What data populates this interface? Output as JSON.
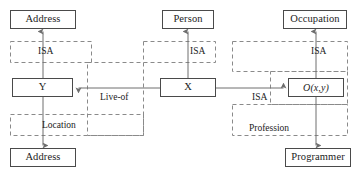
{
  "diagram": {
    "colors": {
      "box_stroke": "#4a4a4a",
      "dashed_stroke": "#8a8a8a",
      "arrow_stroke": "#6e6e6e",
      "text": "#1c1c1c",
      "background": "#ffffff"
    },
    "entities": [
      {
        "id": "address_top",
        "label": "Address",
        "x": 10,
        "y": 10,
        "w": 66,
        "h": 19
      },
      {
        "id": "y_node",
        "label": "Y",
        "x": 12,
        "y": 78,
        "w": 61,
        "h": 19
      },
      {
        "id": "address_bottom",
        "label": "Address",
        "x": 10,
        "y": 148,
        "w": 66,
        "h": 19
      },
      {
        "id": "person",
        "label": "Person",
        "x": 162,
        "y": 10,
        "w": 52,
        "h": 19
      },
      {
        "id": "x_node",
        "label": "X",
        "x": 160,
        "y": 78,
        "w": 56,
        "h": 19
      },
      {
        "id": "occupation",
        "label": "Occupation",
        "x": 283,
        "y": 10,
        "w": 64,
        "h": 19
      },
      {
        "id": "o_xy_node",
        "label": "O(x,y)",
        "x": 288,
        "y": 78,
        "w": 56,
        "h": 19,
        "italic": true
      },
      {
        "id": "programmer",
        "label": "Programmer",
        "x": 285,
        "y": 148,
        "w": 66,
        "h": 19
      }
    ],
    "regions": [
      {
        "id": "isa_left",
        "label": "ISA",
        "label_x": 38,
        "label_y": 47,
        "x": 10,
        "y": 41,
        "w": 81,
        "h": 21
      },
      {
        "id": "location",
        "label": "Location",
        "label_x": 42,
        "label_y": 121,
        "x": 10,
        "y": 114,
        "w": 133,
        "h": 21
      },
      {
        "id": "live_of",
        "label": "Live-of",
        "label_x": 100,
        "label_y": 93,
        "x": 87,
        "y": 62,
        "w": 56,
        "h": 73
      },
      {
        "id": "isa_middle",
        "label": "ISA",
        "label_x": 190,
        "label_y": 47,
        "x": 143,
        "y": 41,
        "w": 72,
        "h": 21
      },
      {
        "id": "isa_right_top",
        "label": "ISA",
        "label_x": 311,
        "label_y": 47,
        "x": 232,
        "y": 41,
        "w": 115,
        "h": 30
      },
      {
        "id": "isa_right_inner",
        "label": "ISA",
        "label_x": 252,
        "label_y": 93,
        "x": 270,
        "y": 71,
        "w": 77,
        "h": 33
      },
      {
        "id": "profession",
        "label": "Profession",
        "label_x": 249,
        "label_y": 124,
        "x": 232,
        "y": 104,
        "w": 115,
        "h": 31
      }
    ],
    "connections": [
      {
        "id": "y-to-address-top",
        "from": "y_node",
        "to": "address_top",
        "kind": "isa-arrow"
      },
      {
        "id": "y-to-address-bottom",
        "from": "y_node",
        "to": "address_bottom",
        "kind": "location-arrow"
      },
      {
        "id": "x-to-person",
        "from": "x_node",
        "to": "person",
        "kind": "isa-arrow"
      },
      {
        "id": "x-to-y",
        "from": "x_node",
        "to": "y_node",
        "kind": "live-of-arrow"
      },
      {
        "id": "x-to-oxy",
        "from": "x_node",
        "to": "o_xy_node",
        "kind": "isa-arrow"
      },
      {
        "id": "oxy-to-occupation",
        "from": "o_xy_node",
        "to": "occupation",
        "kind": "isa-arrow"
      },
      {
        "id": "oxy-to-programmer",
        "from": "o_xy_node",
        "to": "programmer",
        "kind": "profession-arrow"
      }
    ]
  },
  "caption": {
    "text": ""
  }
}
